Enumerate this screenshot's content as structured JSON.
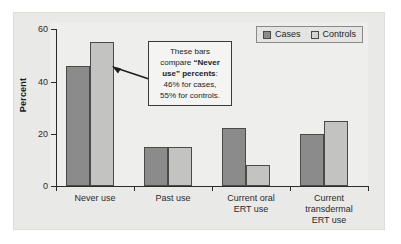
{
  "chart_data": {
    "type": "bar",
    "title": "",
    "xlabel": "",
    "ylabel": "Percent",
    "ylim": [
      0,
      60
    ],
    "yticks": [
      0,
      20,
      40,
      60
    ],
    "ytick_labels": [
      "0",
      "20",
      "40",
      "60"
    ],
    "grid": false,
    "legend_position": "top-right",
    "categories": [
      "Never use",
      "Past use",
      "Current oral ERT use",
      "Current transdermal ERT use"
    ],
    "category_label_lines": [
      [
        "Never use"
      ],
      [
        "Past use"
      ],
      [
        "Current oral",
        "ERT use"
      ],
      [
        "Current",
        "transdermal",
        "ERT use"
      ]
    ],
    "series": [
      {
        "name": "Cases",
        "color": "#8b8b8b",
        "values": [
          46,
          15,
          22,
          20
        ]
      },
      {
        "name": "Controls",
        "color": "#c3c3c1",
        "values": [
          55,
          15,
          8,
          25
        ]
      }
    ],
    "annotations": [
      {
        "name": "never-use-callout",
        "text_lines": [
          "These bars",
          "compare \"Never",
          "use\" percents:",
          "46% for cases,",
          "55% for controls."
        ],
        "bold_fragments": [
          "\"Never",
          "use\" percents"
        ],
        "points_to": "Never use - Controls bar"
      }
    ]
  },
  "axis": {
    "y_title": "Percent",
    "y_tick_0": "0",
    "y_tick_20": "20",
    "y_tick_40": "40",
    "y_tick_60": "60"
  },
  "legend": {
    "cases_label": "Cases",
    "controls_label": "Controls"
  },
  "x_labels": {
    "g0_l0": "Never use",
    "g1_l0": "Past use",
    "g2_l0": "Current oral",
    "g2_l1": "ERT use",
    "g3_l0": "Current",
    "g3_l1": "transdermal",
    "g3_l2": "ERT use"
  },
  "callout": {
    "line1": "These bars",
    "line2a": "compare ",
    "line2b": "“Never",
    "line3a": "use” percents",
    "line3b": ":",
    "line4": "46% for cases,",
    "line5": "55% for controls."
  },
  "colors": {
    "cases": "#8b8b8b",
    "controls": "#c3c3c1",
    "axis": "#2b2b2b",
    "plate": "#e9e9e7",
    "callout_bg": "#f4f4f2"
  }
}
